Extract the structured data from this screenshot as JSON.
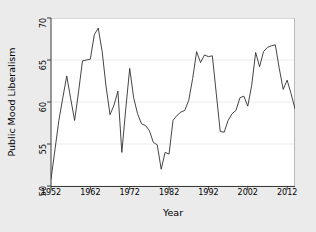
{
  "chart_data": {
    "type": "line",
    "title": "",
    "xlabel": "Year",
    "ylabel": "Public Mood Liberalism",
    "xlim": [
      1952,
      2014
    ],
    "ylim": [
      50,
      70
    ],
    "xticks": [
      1952,
      1962,
      1972,
      1982,
      1992,
      2002,
      2012
    ],
    "yticks": [
      50,
      55,
      60,
      65,
      70
    ],
    "grid": "horizontal",
    "legend": "none",
    "line_color": "#303030",
    "panel_color": "#ffffff",
    "background_color": "#ebebeb",
    "series": [
      {
        "name": "Public Mood Liberalism",
        "x": [
          1952,
          1953,
          1954,
          1955,
          1956,
          1957,
          1958,
          1959,
          1960,
          1961,
          1962,
          1963,
          1964,
          1965,
          1966,
          1967,
          1968,
          1969,
          1970,
          1971,
          1972,
          1973,
          1974,
          1975,
          1976,
          1977,
          1978,
          1979,
          1980,
          1981,
          1982,
          1983,
          1984,
          1985,
          1986,
          1987,
          1988,
          1989,
          1990,
          1991,
          1992,
          1993,
          1994,
          1995,
          1996,
          1997,
          1998,
          1999,
          2000,
          2001,
          2002,
          2003,
          2004,
          2005,
          2006,
          2007,
          2008,
          2009,
          2010,
          2011,
          2012,
          2013,
          2014
        ],
        "values": [
          50.8,
          54.3,
          57.8,
          60.5,
          63.1,
          60.4,
          57.8,
          61.2,
          64.9,
          65.0,
          65.1,
          68.0,
          68.8,
          66.0,
          61.8,
          58.5,
          59.6,
          61.3,
          54.0,
          59.2,
          64.0,
          60.5,
          58.6,
          57.4,
          57.2,
          56.6,
          55.2,
          54.9,
          52.0,
          54.0,
          53.8,
          57.8,
          58.4,
          58.8,
          59.0,
          60.2,
          62.8,
          66.0,
          64.7,
          65.6,
          65.4,
          65.5,
          61.0,
          56.5,
          56.4,
          57.8,
          58.6,
          59.0,
          60.5,
          60.7,
          59.5,
          62.0,
          65.9,
          64.2,
          66.0,
          66.5,
          66.7,
          66.8,
          64.0,
          61.5,
          62.6,
          61.0,
          59.2
        ]
      }
    ]
  },
  "axes": {
    "x_title": "Year",
    "y_title": "Public Mood Liberalism",
    "x_tick_labels": [
      "1952",
      "1962",
      "1972",
      "1982",
      "1992",
      "2002",
      "2012"
    ],
    "y_tick_labels": [
      "50",
      "55",
      "60",
      "65",
      "70"
    ]
  }
}
